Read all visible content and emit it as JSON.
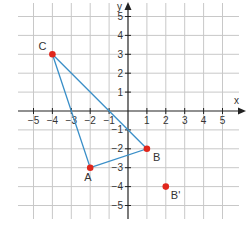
{
  "diagram": {
    "type": "coordinate-plane",
    "axes": {
      "x_label": "x",
      "y_label": "y"
    },
    "x_ticks": [
      "-5",
      "-4",
      "-3",
      "-2",
      "-1",
      "1",
      "2",
      "3",
      "4",
      "5"
    ],
    "y_ticks": [
      "5",
      "4",
      "3",
      "2",
      "1",
      "-1",
      "-2",
      "-3",
      "-4",
      "-5"
    ],
    "range": {
      "x": [
        -5,
        5
      ],
      "y": [
        -5,
        5
      ]
    },
    "colors": {
      "grid": "#c8c8c8",
      "axis": "#222222",
      "triangle": "#3a8fc8",
      "point": "#e0261c"
    },
    "points": [
      {
        "name": "A",
        "label": "A",
        "x": -2,
        "y": -3
      },
      {
        "name": "B",
        "label": "B",
        "x": 1,
        "y": -2
      },
      {
        "name": "C",
        "label": "C",
        "x": -4,
        "y": 3
      },
      {
        "name": "B_prime",
        "label": "B'",
        "x": 2,
        "y": -4
      }
    ],
    "triangle": [
      "A",
      "B",
      "C"
    ]
  }
}
